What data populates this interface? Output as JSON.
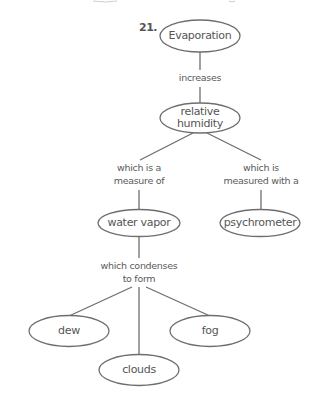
{
  "question_number": "21.",
  "nodes": {
    "evaporation": "Evaporation",
    "relative_humidity": [
      "relative",
      "humidity"
    ],
    "water_vapor": "water vapor",
    "psychrometer": "psychrometer",
    "dew": "dew",
    "clouds": "clouds",
    "fog": "fog"
  },
  "links": {
    "increases": "increases",
    "measure_of": [
      "which is a",
      "measure of"
    ],
    "measured_with": [
      "which is",
      "measured with a"
    ],
    "condenses": [
      "which condenses",
      "to form"
    ]
  },
  "colors": {
    "line": "#6e6e6e",
    "text": "#555555"
  }
}
